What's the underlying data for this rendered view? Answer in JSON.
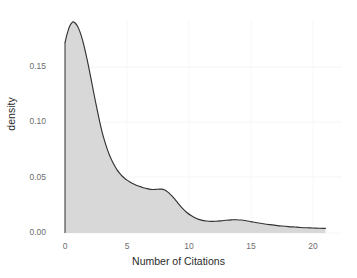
{
  "chart_data": {
    "type": "area",
    "title": "",
    "subtitle": "",
    "xlabel": "Number of Citations",
    "ylabel": "density",
    "xlim": [
      -1.2,
      21.5
    ],
    "ylim": [
      0.0,
      0.1945
    ],
    "xticks": [
      0,
      5,
      10,
      15,
      20
    ],
    "xtick_labels": [
      "0",
      "5",
      "10",
      "15",
      "20"
    ],
    "yticks": [
      0.0,
      0.05,
      0.1,
      0.15
    ],
    "ytick_labels": [
      "0.00",
      "0.05",
      "0.10",
      "0.15"
    ],
    "grid": true,
    "legend": null,
    "legend_position": "none",
    "annotations": [],
    "series": [
      {
        "name": "density",
        "kind": "kde",
        "fill": true,
        "x": [
          0.0,
          0.2,
          0.4,
          0.6,
          0.65,
          0.8,
          1.0,
          1.2,
          1.4,
          1.6,
          1.8,
          2.0,
          2.2,
          2.4,
          2.6,
          2.8,
          3.0,
          3.2,
          3.4,
          3.6,
          3.8,
          4.0,
          4.2,
          4.4,
          4.6,
          4.8,
          5.0,
          5.2,
          5.4,
          5.6,
          5.8,
          6.0,
          6.2,
          6.4,
          6.6,
          6.8,
          7.0,
          7.2,
          7.4,
          7.6,
          7.8,
          8.0,
          8.2,
          8.4,
          8.6,
          8.8,
          9.0,
          9.4,
          9.8,
          10.2,
          10.6,
          11.0,
          11.4,
          11.8,
          12.2,
          12.6,
          13.0,
          13.4,
          13.6,
          13.8,
          14.2,
          14.6,
          15.0,
          15.5,
          16.0,
          16.5,
          17.0,
          17.5,
          18.0,
          18.5,
          19.0,
          19.5,
          20.0,
          20.5,
          21.0
        ],
        "y": [
          0.172,
          0.181,
          0.1875,
          0.1905,
          0.1908,
          0.19,
          0.187,
          0.182,
          0.175,
          0.166,
          0.156,
          0.145,
          0.1335,
          0.122,
          0.111,
          0.1005,
          0.091,
          0.083,
          0.076,
          0.07,
          0.065,
          0.0607,
          0.057,
          0.054,
          0.0515,
          0.0495,
          0.0478,
          0.0463,
          0.045,
          0.044,
          0.043,
          0.0422,
          0.0414,
          0.0407,
          0.0401,
          0.0396,
          0.0393,
          0.0393,
          0.0395,
          0.0397,
          0.0396,
          0.039,
          0.0378,
          0.036,
          0.0337,
          0.0312,
          0.0285,
          0.0232,
          0.0188,
          0.0155,
          0.0131,
          0.0116,
          0.0108,
          0.0105,
          0.0106,
          0.011,
          0.0115,
          0.0119,
          0.012,
          0.012,
          0.0117,
          0.0111,
          0.0103,
          0.0093,
          0.0084,
          0.0076,
          0.0069,
          0.0063,
          0.0058,
          0.0054,
          0.005,
          0.0047,
          0.0045,
          0.0043,
          0.0042
        ],
        "peak": {
          "x": 0.65,
          "y": 0.1908
        },
        "secondary_peaks": [
          {
            "x": 7.55,
            "y": 0.0397
          },
          {
            "x": 13.65,
            "y": 0.012
          }
        ]
      }
    ],
    "colors": {
      "fill": "#d8d8d8",
      "line": "#333333",
      "grid": "#f2f2f2",
      "background": "#ffffff",
      "tick_text": "#6e6e6e",
      "axis_title_text": "#2b2b2b"
    }
  },
  "axes": {
    "x_title": "Number of Citations",
    "y_title": "density"
  },
  "ticks": {
    "y": [
      {
        "label": "0.15",
        "top": 62
      },
      {
        "label": "0.10",
        "top": 117
      },
      {
        "label": "0.05",
        "top": 173
      },
      {
        "label": "0.00",
        "top": 228
      }
    ],
    "x": [
      {
        "label": "0",
        "left": 50
      },
      {
        "label": "5",
        "left": 112
      },
      {
        "label": "10",
        "left": 174
      },
      {
        "label": "15",
        "left": 236
      },
      {
        "label": "20",
        "left": 298
      }
    ]
  }
}
